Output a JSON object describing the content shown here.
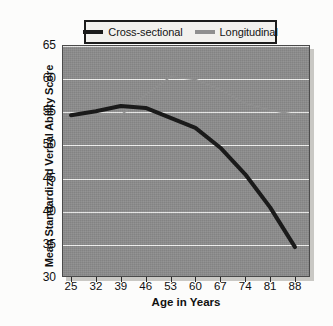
{
  "figure": {
    "background_color": "#fcfcfb",
    "plot_background_color": "#8c8c8c",
    "gridline_color": "#f0f0ee"
  },
  "legend": {
    "border_color": "#1c1c1c",
    "background_color": "#f2f1ee",
    "entries": [
      {
        "label": "Cross-sectional",
        "color": "#1a1a1a"
      },
      {
        "label": "Longitudinal",
        "color": "#8f8f8f"
      }
    ]
  },
  "axes": {
    "ylabel": "Mean Standardized Verbal Ability Score",
    "xlabel": "Age in Years",
    "yticks": [
      "65",
      "60",
      "55",
      "50",
      "45",
      "40",
      "35",
      "30"
    ],
    "xticks": [
      "25",
      "32",
      "39",
      "46",
      "53",
      "60",
      "67",
      "74",
      "81",
      "88"
    ]
  },
  "chart_data": {
    "type": "line",
    "title": "",
    "xlabel": "Age in Years",
    "ylabel": "Mean Standardized Verbal Ability Score",
    "x": [
      25,
      32,
      39,
      46,
      53,
      60,
      67,
      74,
      81,
      88
    ],
    "xlim": [
      25,
      88
    ],
    "ylim": [
      30,
      65
    ],
    "ytick_values": [
      30,
      35,
      40,
      45,
      50,
      55,
      60,
      65
    ],
    "grid": "horizontal",
    "legend_position": "above-plot",
    "series": [
      {
        "name": "Cross-sectional",
        "color": "#1a1a1a",
        "linewidth": 4,
        "values": [
          54.4,
          55.0,
          55.8,
          55.5,
          54.0,
          52.5,
          49.5,
          45.5,
          40.5,
          34.5
        ]
      },
      {
        "name": "Longitudinal",
        "color": "#8f8f8f",
        "linewidth": 1.6,
        "values": [
          54.3,
          54.5,
          54.4,
          57.5,
          60.2,
          59.8,
          58.3,
          56.2,
          55.2,
          54.5
        ]
      }
    ]
  }
}
